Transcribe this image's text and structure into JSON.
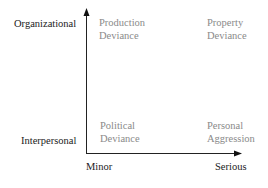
{
  "diagram": {
    "y_axis": {
      "top_label": "Organizational",
      "bottom_label": "Interpersonal"
    },
    "x_axis": {
      "left_label": "Minor",
      "right_label": "Serious"
    },
    "quadrants": {
      "top_left": {
        "line1": "Production",
        "line2": "Deviance"
      },
      "top_right": {
        "line1": "Property",
        "line2": "Deviance"
      },
      "bottom_left": {
        "line1": "Political",
        "line2": "Deviance"
      },
      "bottom_right": {
        "line1": "Personal",
        "line2": "Aggression"
      }
    },
    "colors": {
      "axis": "#222222",
      "quadrant_text": "#8a8a8a"
    }
  }
}
